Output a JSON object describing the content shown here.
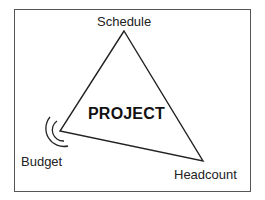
{
  "diagram": {
    "type": "project-triangle",
    "center_label": "PROJECT",
    "vertices": [
      {
        "name": "Schedule",
        "position": "top"
      },
      {
        "name": "Budget",
        "position": "bottom-left",
        "marker": "motion-arcs"
      },
      {
        "name": "Headcount",
        "position": "bottom-right"
      }
    ],
    "colors": {
      "line": "#222222",
      "frame": "#555555",
      "background": "#ffffff"
    }
  }
}
